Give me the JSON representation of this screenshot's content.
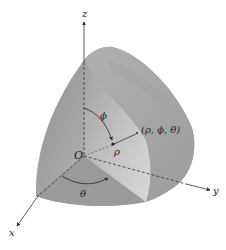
{
  "figure": {
    "type": "spherical-coordinates-diagram",
    "axes": {
      "z_label": "z",
      "y_label": "y",
      "x_label": "x",
      "origin_label": "O"
    },
    "annotations": {
      "phi_label": "ϕ",
      "rho_label": "ρ",
      "theta_label": "θ",
      "point_label": "(ρ, ϕ, θ)"
    },
    "colors": {
      "solid_dark": "#8e8e8e",
      "solid_mid": "#a6a6a6",
      "solid_light": "#c9c9c9",
      "cut_face": "#b8b8b8",
      "axis": "#333333",
      "background": "#ffffff"
    }
  }
}
